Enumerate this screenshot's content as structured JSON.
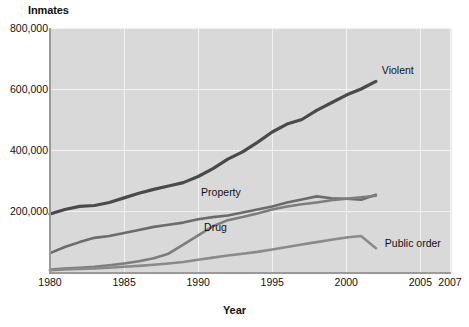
{
  "chart_data": {
    "type": "line",
    "title": "",
    "ylabel": "Inmates",
    "xlabel": "Year",
    "xlim": [
      1980,
      2007
    ],
    "ylim": [
      0,
      800000
    ],
    "grid": true,
    "legend_position": "inline-annotations",
    "x_tick_labels": [
      "1980",
      "1985",
      "1990",
      "1995",
      "2000",
      "2005",
      "2007"
    ],
    "x_ticks": [
      1980,
      1985,
      1990,
      1995,
      2000,
      2005,
      2007
    ],
    "y_tick_labels": [
      "800,000",
      "600,000",
      "400,000",
      "200,000"
    ],
    "y_ticks": [
      800000,
      600000,
      400000,
      200000
    ],
    "series": [
      {
        "name": "Violent",
        "color": "#4a4a4a",
        "x": [
          1980,
          1981,
          1982,
          1983,
          1984,
          1985,
          1986,
          1987,
          1988,
          1989,
          1990,
          1991,
          1992,
          1993,
          1994,
          1995,
          1996,
          1997,
          1998,
          1999,
          2000,
          2001,
          2002
        ],
        "values": [
          190000,
          205000,
          215000,
          218000,
          228000,
          243000,
          258000,
          271000,
          282000,
          293000,
          313000,
          339000,
          370000,
          394000,
          425000,
          459000,
          485000,
          500000,
          530000,
          555000,
          580000,
          600000,
          625000
        ]
      },
      {
        "name": "Property",
        "color": "#6b6b6b",
        "x": [
          1980,
          1981,
          1982,
          1983,
          1984,
          1985,
          1986,
          1987,
          1988,
          1989,
          1990,
          1991,
          1992,
          1993,
          1994,
          1995,
          1996,
          1997,
          1998,
          1999,
          2000,
          2001,
          2002
        ],
        "values": [
          62000,
          82000,
          98000,
          112000,
          118000,
          128000,
          138000,
          148000,
          155000,
          162000,
          173000,
          180000,
          185000,
          195000,
          205000,
          215000,
          228000,
          238000,
          248000,
          242000,
          240000,
          237000,
          253000
        ]
      },
      {
        "name": "Drug",
        "color": "#7d7d7d",
        "x": [
          1980,
          1981,
          1982,
          1983,
          1984,
          1985,
          1986,
          1987,
          1988,
          1989,
          1990,
          1991,
          1992,
          1993,
          1994,
          1995,
          1996,
          1997,
          1998,
          1999,
          2000,
          2001,
          2002
        ],
        "values": [
          8000,
          11000,
          14000,
          17000,
          22000,
          28000,
          35000,
          45000,
          60000,
          90000,
          120000,
          150000,
          170000,
          180000,
          192000,
          205000,
          215000,
          222000,
          228000,
          235000,
          240000,
          245000,
          250000
        ]
      },
      {
        "name": "Public order",
        "color": "#8a8a8a",
        "x": [
          1980,
          1981,
          1982,
          1983,
          1984,
          1985,
          1986,
          1987,
          1988,
          1989,
          1990,
          1991,
          1992,
          1993,
          1994,
          1995,
          1996,
          1997,
          1998,
          1999,
          2000,
          2001,
          2002
        ],
        "values": [
          6000,
          8000,
          10000,
          12000,
          14000,
          17000,
          20000,
          24000,
          28000,
          33000,
          40000,
          47000,
          54000,
          60000,
          66000,
          74000,
          82000,
          90000,
          98000,
          106000,
          113000,
          118000,
          78000
        ]
      }
    ],
    "annotations": [
      {
        "text": "Violent",
        "x": 2002.4,
        "y": 660000
      },
      {
        "text": "Property",
        "x": 1990.2,
        "y": 258000
      },
      {
        "text": "Drug",
        "x": 1990.4,
        "y": 143000
      },
      {
        "text": "Public order",
        "x": 2002.6,
        "y": 92000
      }
    ]
  }
}
